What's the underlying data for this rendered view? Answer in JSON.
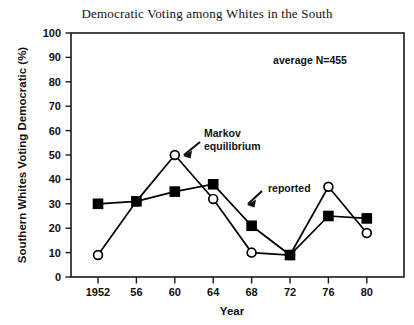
{
  "chart_data": {
    "type": "line",
    "title": "Democratic Voting among Whites in the South",
    "xlabel": "Year",
    "ylabel": "Southern Whites Voting Democratic  (%)",
    "x": [
      1952,
      1956,
      1960,
      1964,
      1968,
      1972,
      1976,
      1980
    ],
    "categories": [
      "1952",
      "56",
      "60",
      "64",
      "68",
      "72",
      "76",
      "80"
    ],
    "xtick_labels": [
      "1952",
      "56",
      "60",
      "64",
      "68",
      "72",
      "76",
      "80"
    ],
    "ytick_labels": [
      "0",
      "10",
      "20",
      "30",
      "40",
      "50",
      "60",
      "70",
      "80",
      "90",
      "100"
    ],
    "ylim": [
      0,
      100
    ],
    "ytick_step": 10,
    "grid": false,
    "legend": "none",
    "series": [
      {
        "name": "Markov equilibrium",
        "marker": "open-circle",
        "values": [
          9,
          31,
          50,
          32,
          10,
          9,
          37,
          18
        ]
      },
      {
        "name": "reported",
        "marker": "filled-square",
        "values": [
          30,
          31,
          35,
          38,
          21,
          9,
          25,
          24
        ]
      }
    ],
    "annotations": [
      {
        "id": "markov-equilibrium",
        "line1": "Markov",
        "line2": "equilibrium",
        "text": "Markov equilibrium"
      },
      {
        "id": "reported",
        "line1": "reported",
        "line2": "",
        "text": "reported"
      },
      {
        "id": "average-n",
        "line1": "average  N=455",
        "line2": "",
        "text": "average  N=455"
      }
    ],
    "colors": {
      "line": "#000000",
      "marker_fill": "#000000",
      "marker_open_fill": "#ffffff",
      "axis": "#1a1a1a",
      "background": "#ffffff",
      "text": "#111111"
    }
  }
}
